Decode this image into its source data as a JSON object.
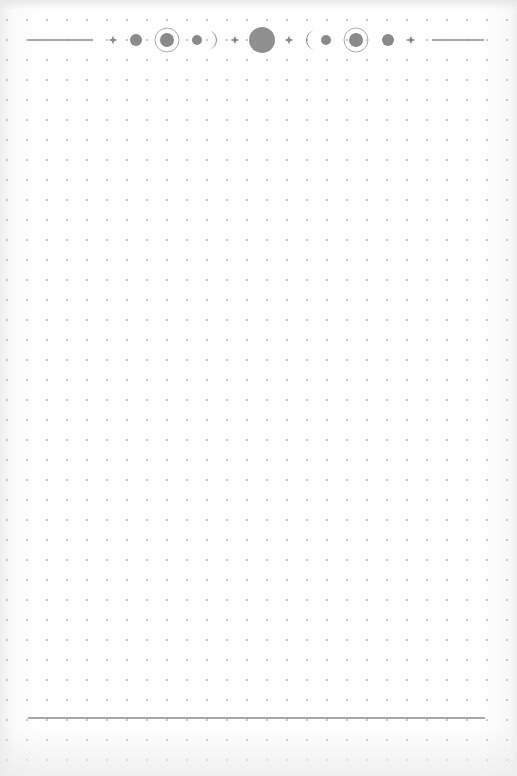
{
  "page": {
    "type": "dot-grid-notebook-page",
    "grid": {
      "spacing_px": 20,
      "origin_x": 7,
      "origin_y": 20,
      "dot_color": "#b9b9b9",
      "dot_radius": 1
    },
    "background_color": "#ffffff",
    "ink_color": "#8a8a8a"
  },
  "header_ornament": {
    "name": "moon-phases-divider",
    "center_y": 40,
    "items": [
      {
        "kind": "line",
        "x1": 28,
        "x2": 93
      },
      {
        "kind": "sparkle",
        "x": 113
      },
      {
        "kind": "dot",
        "x": 136,
        "r": 6
      },
      {
        "kind": "ringed-circle",
        "x": 167,
        "r_inner": 7,
        "r_outer": 12
      },
      {
        "kind": "dot",
        "x": 197,
        "r": 5
      },
      {
        "kind": "crescent-right",
        "x": 211
      },
      {
        "kind": "sparkle",
        "x": 235
      },
      {
        "kind": "full-moon",
        "x": 262,
        "r": 13
      },
      {
        "kind": "sparkle",
        "x": 289
      },
      {
        "kind": "crescent-left",
        "x": 312
      },
      {
        "kind": "dot",
        "x": 326,
        "r": 5
      },
      {
        "kind": "ringed-circle",
        "x": 356,
        "r_inner": 7,
        "r_outer": 12
      },
      {
        "kind": "dot",
        "x": 388,
        "r": 6
      },
      {
        "kind": "sparkle",
        "x": 411
      },
      {
        "kind": "line",
        "x1": 432,
        "x2": 484
      }
    ]
  },
  "footer_rule": {
    "x1": 28,
    "x2": 485,
    "y": 718
  }
}
